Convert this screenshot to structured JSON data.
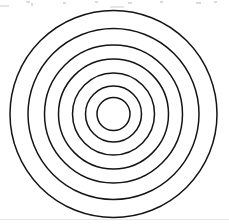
{
  "figure": {
    "width": 229,
    "height": 224,
    "background_color": "#ffffff",
    "stroke_color": "#141414",
    "stroke_width": 1.5,
    "fill": "none",
    "center": {
      "x": 113.5,
      "y": 114
    },
    "circle_count": 7
  },
  "chart_data": {
    "type": "scatter",
    "xlabel": "",
    "ylabel": "",
    "xlim": [
      0,
      229
    ],
    "ylim": [
      0,
      224
    ],
    "grid": false,
    "legend": "none",
    "center": {
      "x": 113.5,
      "y": 114
    },
    "radii": [
      16.5,
      28,
      41,
      55,
      69,
      85.5,
      103.5
    ],
    "circles": [
      {
        "index": 1,
        "label": "innermost-circle",
        "cx": 113.5,
        "cy": 114,
        "r": 16.5
      },
      {
        "index": 2,
        "label": "circle-2",
        "cx": 113.5,
        "cy": 114,
        "r": 28
      },
      {
        "index": 3,
        "label": "circle-3",
        "cx": 113.5,
        "cy": 114,
        "r": 41
      },
      {
        "index": 4,
        "label": "circle-4",
        "cx": 113.5,
        "cy": 114,
        "r": 55
      },
      {
        "index": 5,
        "label": "circle-5",
        "cx": 113.5,
        "cy": 114,
        "r": 69
      },
      {
        "index": 6,
        "label": "circle-6",
        "cx": 113.5,
        "cy": 114,
        "r": 85.5
      },
      {
        "index": 7,
        "label": "outermost-circle",
        "cx": 113.5,
        "cy": 114,
        "r": 103.5
      }
    ],
    "annotations": []
  },
  "artifacts": {
    "top_edge_specks": [
      {
        "x": 26,
        "y": 1,
        "w": 4,
        "h": 2
      },
      {
        "x": 31,
        "y": 3,
        "w": 2,
        "h": 3
      },
      {
        "x": 63,
        "y": 2,
        "w": 3,
        "h": 2
      },
      {
        "x": 95,
        "y": 1,
        "w": 3,
        "h": 2
      },
      {
        "x": 128,
        "y": 2,
        "w": 4,
        "h": 2
      },
      {
        "x": 160,
        "y": 1,
        "w": 3,
        "h": 2
      },
      {
        "x": 196,
        "y": 2,
        "w": 5,
        "h": 2
      },
      {
        "x": 214,
        "y": 1,
        "w": 3,
        "h": 2
      }
    ],
    "edge_smudges": [
      {
        "x": 0,
        "y": 5,
        "w": 9,
        "h": 2
      },
      {
        "x": 110,
        "y": 6,
        "w": 14,
        "h": 2
      },
      {
        "x": 0,
        "y": 219,
        "w": 229,
        "h": 1
      }
    ]
  }
}
